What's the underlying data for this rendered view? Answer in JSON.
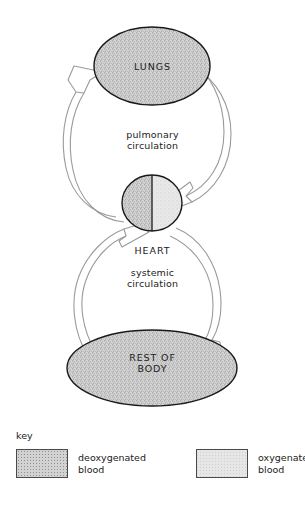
{
  "diagram": {
    "nodes": [
      {
        "id": "lungs",
        "label": "LUNGS",
        "shape": "ellipse",
        "fill": "deoxygenated"
      },
      {
        "id": "heart",
        "label": "HEART",
        "shape": "ellipse-split",
        "fill_left": "deoxygenated",
        "fill_right": "oxygenated"
      },
      {
        "id": "body",
        "label": "REST OF\nBODY",
        "shape": "ellipse",
        "fill": "deoxygenated"
      }
    ],
    "circuit_labels": {
      "pulmonary": "pulmonary\ncirculation",
      "systemic": "systemic\ncirculation"
    },
    "arrows": [
      {
        "id": "heart-to-lungs",
        "from": "heart",
        "to": "lungs",
        "side": "left",
        "blood": "deoxygenated"
      },
      {
        "id": "lungs-to-heart",
        "from": "lungs",
        "to": "heart",
        "side": "right",
        "blood": "oxygenated"
      },
      {
        "id": "heart-to-body",
        "from": "heart",
        "to": "body",
        "side": "right",
        "blood": "oxygenated"
      },
      {
        "id": "body-to-heart",
        "from": "body",
        "to": "heart",
        "side": "left",
        "blood": "deoxygenated"
      }
    ]
  },
  "key": {
    "title": "key",
    "entries": [
      {
        "id": "deoxygenated",
        "label": "deoxygenated\nblood",
        "swatch": "deoxygenated"
      },
      {
        "id": "oxygenated",
        "label": "oxygenated\nblood",
        "swatch": "oxygenated"
      }
    ]
  },
  "colors": {
    "outline": "#1a1a1a",
    "arrow_stroke": "#9a9a9a",
    "arrow_fill": "#ffffff",
    "deoxygenated_fill": "#d2d2d2",
    "oxygenated_fill": "#e6e6e6",
    "text": "#222222",
    "background": "#ffffff"
  }
}
